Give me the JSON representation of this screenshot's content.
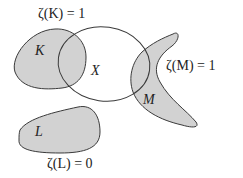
{
  "diagram": {
    "fill_color": "#d2d2d2",
    "stroke_color": "#3a3a3a",
    "set_label": "X",
    "regions": [
      {
        "id": "K",
        "label": "K",
        "annotation": "ζ(K) = 1",
        "intersects_X": true
      },
      {
        "id": "M",
        "label": "M",
        "annotation": "ζ(M) = 1",
        "intersects_X": true
      },
      {
        "id": "L",
        "label": "L",
        "annotation": "ζ(L) = 0",
        "intersects_X": false
      }
    ]
  }
}
